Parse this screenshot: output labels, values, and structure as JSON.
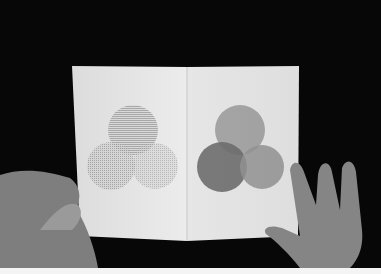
{
  "scene": {
    "description": "Photograph of an open book held by two hands against a black background; each page shows three overlapping circles (Venn-style), left page in halftone dot textures, right page in solid grey tones",
    "background_color": "#070707",
    "page_color": "#e8e8e8",
    "left_page": {
      "circles": [
        {
          "name": "top",
          "cx": 133,
          "cy": 130,
          "r": 25,
          "fill": "#bdbdbd"
        },
        {
          "name": "bottom-left",
          "cx": 111,
          "cy": 166,
          "r": 24,
          "fill": "#a8a8a8"
        },
        {
          "name": "bottom-right",
          "cx": 155,
          "cy": 166,
          "r": 23,
          "fill": "#c4c4c4"
        }
      ]
    },
    "right_page": {
      "circles": [
        {
          "name": "top",
          "cx": 240,
          "cy": 130,
          "r": 25,
          "fill": "#b4b4b4"
        },
        {
          "name": "bottom-left",
          "cx": 222,
          "cy": 167,
          "r": 25,
          "fill": "#6e6e6e"
        },
        {
          "name": "bottom-right",
          "cx": 262,
          "cy": 167,
          "r": 22,
          "fill": "#9a9a9a"
        }
      ]
    }
  }
}
